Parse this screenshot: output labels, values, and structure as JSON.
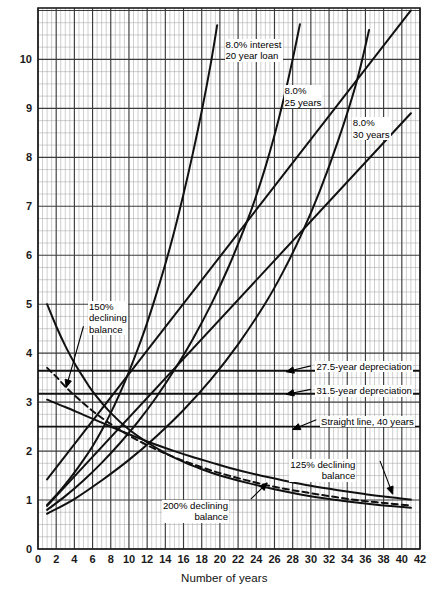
{
  "figure": {
    "kind": "engineering-graph",
    "background": "#ffffff",
    "grid_color_minor": "#9a9a9a",
    "grid_color_major": "#3a3a3a",
    "curve_color": "#111111"
  },
  "chart_data": {
    "type": "line",
    "title": "",
    "subtitle": "",
    "xlabel": "Number of years",
    "ylabel": "",
    "xlim": [
      0,
      42
    ],
    "ylim": [
      0,
      11.05
    ],
    "grid": true,
    "legend_position": "inline-annotations",
    "xticks": [
      0,
      2,
      4,
      6,
      8,
      10,
      12,
      14,
      16,
      18,
      20,
      22,
      24,
      26,
      28,
      30,
      32,
      34,
      36,
      38,
      40,
      42
    ],
    "xtick_labels": [
      "0",
      "2",
      "4",
      "6",
      "8",
      "10",
      "12",
      "14",
      "16",
      "18",
      "20",
      "22",
      "24",
      "26",
      "28",
      "30",
      "32",
      "34",
      "36",
      "38",
      "40",
      "42"
    ],
    "yticks": [
      0,
      1,
      2,
      3,
      4,
      5,
      6,
      7,
      8,
      9,
      10
    ],
    "ytick_labels": [
      "0",
      "1",
      "2",
      "3",
      "4",
      "5",
      "6",
      "7",
      "8",
      "9",
      "10"
    ],
    "minor_x_step": 0.5,
    "minor_y_step": 0.25,
    "series": [
      {
        "name": "8.0% interest 20 year loan",
        "style": "solid",
        "label": "8.0% interest\n20 year loan",
        "points": [
          [
            1,
            0.9
          ],
          [
            2,
            1.1
          ],
          [
            3,
            1.32
          ],
          [
            4,
            1.56
          ],
          [
            5,
            1.82
          ],
          [
            6,
            2.1
          ],
          [
            7,
            2.42
          ],
          [
            8,
            2.78
          ],
          [
            9,
            3.18
          ],
          [
            10,
            3.62
          ],
          [
            11,
            4.1
          ],
          [
            12,
            4.62
          ],
          [
            13,
            5.2
          ],
          [
            14,
            5.82
          ],
          [
            15,
            6.5
          ],
          [
            16,
            7.25
          ],
          [
            17,
            8.06
          ],
          [
            18,
            8.94
          ],
          [
            19,
            9.92
          ],
          [
            19.7,
            10.7
          ]
        ]
      },
      {
        "name": "8.0% 25 years",
        "style": "solid",
        "label": "8.0%\n25 years",
        "points": [
          [
            1,
            0.8
          ],
          [
            3,
            1.08
          ],
          [
            5,
            1.4
          ],
          [
            7,
            1.76
          ],
          [
            9,
            2.16
          ],
          [
            11,
            2.6
          ],
          [
            13,
            3.1
          ],
          [
            15,
            3.66
          ],
          [
            17,
            4.28
          ],
          [
            19,
            4.98
          ],
          [
            21,
            5.78
          ],
          [
            23,
            6.7
          ],
          [
            24,
            7.22
          ],
          [
            25,
            7.8
          ],
          [
            26,
            8.45
          ],
          [
            27,
            9.18
          ],
          [
            28,
            10.0
          ],
          [
            28.8,
            10.72
          ]
        ]
      },
      {
        "name": "8.0% 30 years",
        "style": "solid",
        "label": "8.0%\n30 years",
        "points": [
          [
            1,
            0.72
          ],
          [
            4,
            1.02
          ],
          [
            7,
            1.4
          ],
          [
            10,
            1.82
          ],
          [
            13,
            2.3
          ],
          [
            16,
            2.84
          ],
          [
            19,
            3.46
          ],
          [
            22,
            4.18
          ],
          [
            25,
            5.02
          ],
          [
            27,
            5.68
          ],
          [
            29,
            6.44
          ],
          [
            31,
            7.32
          ],
          [
            33,
            8.34
          ],
          [
            35,
            9.52
          ],
          [
            36.4,
            10.6
          ]
        ]
      },
      {
        "name": "150% declining balance",
        "style": "dashed",
        "label": "150%\ndeclining\nbalance",
        "points": [
          [
            1,
            3.7
          ],
          [
            2,
            3.52
          ],
          [
            3,
            3.32
          ],
          [
            4,
            3.14
          ],
          [
            6,
            2.82
          ],
          [
            8,
            2.55
          ],
          [
            10,
            2.32
          ],
          [
            12,
            2.12
          ],
          [
            14,
            1.95
          ],
          [
            16,
            1.8
          ],
          [
            18,
            1.67
          ],
          [
            20,
            1.55
          ],
          [
            23,
            1.4
          ],
          [
            26,
            1.27
          ],
          [
            29,
            1.17
          ],
          [
            32,
            1.08
          ],
          [
            35,
            1.0
          ],
          [
            38,
            0.94
          ],
          [
            41,
            0.89
          ]
        ]
      },
      {
        "name": "200% declining balance",
        "style": "solid",
        "label": "200% declining\nbalance",
        "points": [
          [
            1,
            5.0
          ],
          [
            2,
            4.55
          ],
          [
            3,
            4.15
          ],
          [
            4,
            3.8
          ],
          [
            5,
            3.5
          ],
          [
            6,
            3.22
          ],
          [
            8,
            2.78
          ],
          [
            10,
            2.44
          ],
          [
            12,
            2.18
          ],
          [
            14,
            1.96
          ],
          [
            16,
            1.78
          ],
          [
            18,
            1.63
          ],
          [
            20,
            1.5
          ],
          [
            23,
            1.35
          ],
          [
            26,
            1.22
          ],
          [
            29,
            1.11
          ],
          [
            32,
            1.02
          ],
          [
            35,
            0.95
          ],
          [
            38,
            0.89
          ],
          [
            41,
            0.84
          ]
        ]
      },
      {
        "name": "125% declining balance",
        "style": "solid",
        "label": "125% declining\nbalance",
        "points": [
          [
            1,
            3.05
          ],
          [
            3,
            2.9
          ],
          [
            5,
            2.74
          ],
          [
            7,
            2.58
          ],
          [
            9,
            2.42
          ],
          [
            11,
            2.27
          ],
          [
            13,
            2.13
          ],
          [
            15,
            2.0
          ],
          [
            17,
            1.88
          ],
          [
            19,
            1.77
          ],
          [
            21,
            1.66
          ],
          [
            24,
            1.52
          ],
          [
            27,
            1.4
          ],
          [
            30,
            1.29
          ],
          [
            33,
            1.2
          ],
          [
            36,
            1.12
          ],
          [
            39,
            1.05
          ],
          [
            41,
            1.01
          ]
        ]
      },
      {
        "name": "27.5-year depreciation",
        "style": "solid-horizontal",
        "label": "27.5-year depreciation",
        "y": 3.64,
        "x_range": [
          0,
          42
        ]
      },
      {
        "name": "31.5-year depreciation",
        "style": "solid-horizontal",
        "label": "31.5-year depreciation",
        "y": 3.17,
        "x_range": [
          0,
          42
        ]
      },
      {
        "name": "Straight line, 40 years",
        "style": "solid-horizontal",
        "label": "Straight line, 40 years",
        "y": 2.5,
        "x_range": [
          0,
          42
        ]
      },
      {
        "name": "rising line A",
        "style": "solid-straight",
        "points": [
          [
            1,
            1.42
          ],
          [
            41,
            11.0
          ]
        ]
      },
      {
        "name": "rising line B",
        "style": "solid-straight",
        "points": [
          [
            1,
            0.88
          ],
          [
            41,
            8.9
          ]
        ]
      }
    ],
    "annotations": [
      {
        "id": "ann-20yr",
        "text": "8.0% interest\n20 year loan",
        "x": 20.5,
        "y": 10.3
      },
      {
        "id": "ann-25yr",
        "text": "8.0%\n25 years",
        "x": 27.0,
        "y": 9.35
      },
      {
        "id": "ann-30yr",
        "text": "8.0%\n30 years",
        "x": 34.5,
        "y": 8.7
      },
      {
        "id": "ann-150",
        "text": "150%\ndeclining\nbalance",
        "x": 5.5,
        "y": 4.95
      },
      {
        "id": "ann-275",
        "text": "27.5-year depreciation",
        "x": 30.5,
        "y": 3.72
      },
      {
        "id": "ann-315",
        "text": "31.5-year depreciation",
        "x": 30.5,
        "y": 3.22
      },
      {
        "id": "ann-sl40",
        "text": "Straight line, 40 years",
        "x": 31.0,
        "y": 2.6
      },
      {
        "id": "ann-125",
        "text": "125% declining\nbalance",
        "x": 35.0,
        "y": 1.72
      },
      {
        "id": "ann-200",
        "text": "200% declining\nbalance",
        "x": 21.0,
        "y": 0.88
      }
    ]
  },
  "labels": {
    "xaxis_title": "Number of years",
    "ann_20yr_line1": "8.0% interest",
    "ann_20yr_line2": "20 year loan",
    "ann_25yr_line1": "8.0%",
    "ann_25yr_line2": "25 years",
    "ann_30yr_line1": "8.0%",
    "ann_30yr_line2": "30 years",
    "ann_150_line1": "150%",
    "ann_150_line2": "declining",
    "ann_150_line3": "balance",
    "ann_275": "27.5-year depreciation",
    "ann_315": "31.5-year depreciation",
    "ann_sl40": "Straight line, 40 years",
    "ann_125_line1": "125% declining",
    "ann_125_line2": "balance",
    "ann_200_line1": "200% declining",
    "ann_200_line2": "balance"
  }
}
